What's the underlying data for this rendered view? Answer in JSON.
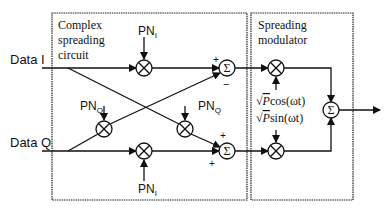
{
  "diagram": {
    "boxes": {
      "complex": {
        "label_lines": [
          "Complex",
          "spreading",
          "circuit"
        ]
      },
      "modulator": {
        "label_lines": [
          "Spreading",
          "modulator"
        ]
      }
    },
    "inputs": {
      "data_i": "Data I",
      "data_q": "Data Q"
    },
    "pn": {
      "top": {
        "base": "PN",
        "sub": "I"
      },
      "bottom": {
        "base": "PN",
        "sub": "I"
      },
      "left_mid": {
        "base": "PN",
        "sub": "Q"
      },
      "right_mid": {
        "base": "PN",
        "sub": "Q"
      }
    },
    "sum_symbol": "Σ",
    "signs": {
      "top_sum_upper": "+",
      "top_sum_lower": "−",
      "bottom_sum_upper": "+",
      "bottom_sum_lower": "+"
    },
    "carriers": {
      "cos": {
        "sqrt": "√",
        "P": "P",
        "fn": "cos(ωt)"
      },
      "sin": {
        "sqrt": "√",
        "P": "P",
        "fn": "sin(ωt)"
      }
    }
  }
}
